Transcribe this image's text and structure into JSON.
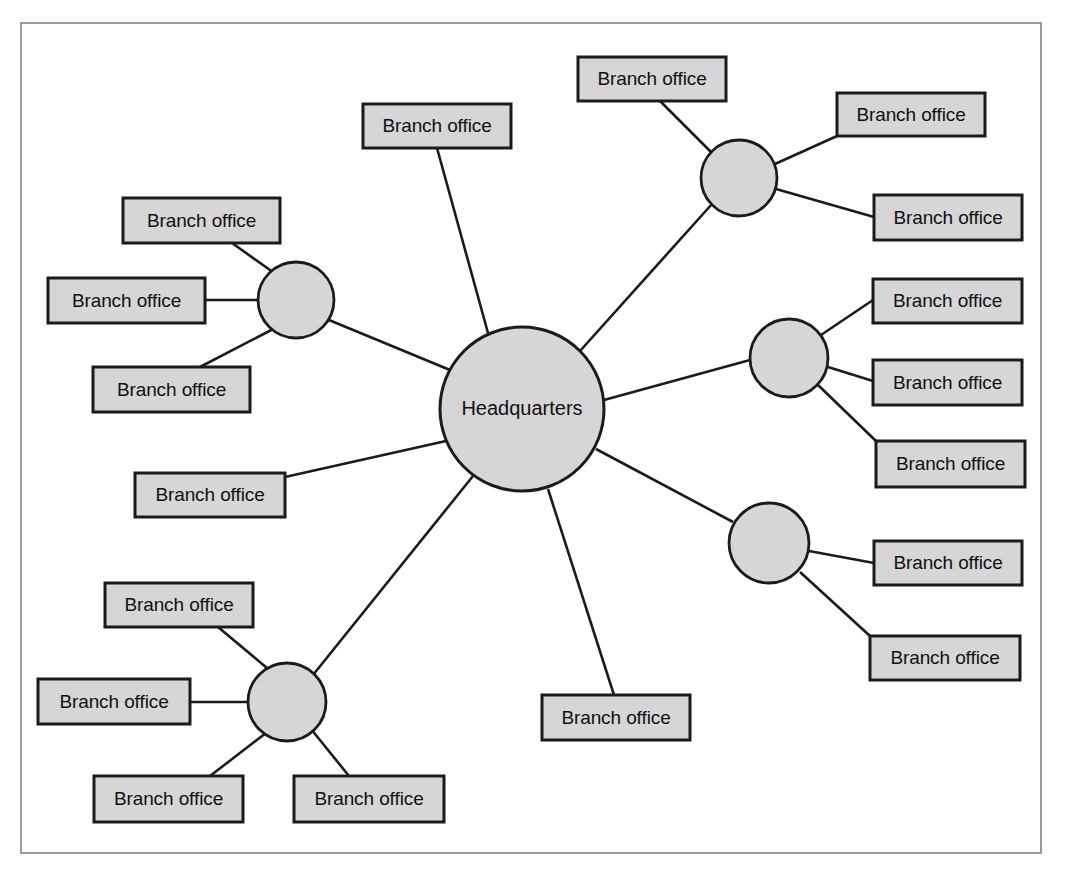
{
  "diagram": {
    "type": "hub-and-spoke-network",
    "canvas": {
      "width": 1065,
      "height": 870
    },
    "frame": {
      "x": 21,
      "y": 23,
      "width": 1020,
      "height": 830,
      "stroke": "#9a9a9a"
    },
    "colors": {
      "node_fill": "#d6d6d6",
      "node_stroke": "#1b1b1b",
      "edge": "#1b1b1b",
      "background": "#ffffff",
      "frame_stroke": "#9a9a9a",
      "text": "#111111"
    },
    "center": {
      "id": "hq",
      "label": "Headquarters",
      "shape": "circle",
      "cx": 522,
      "cy": 409,
      "r": 82
    },
    "hubs": [
      {
        "id": "hub-top-right",
        "label": "",
        "shape": "circle",
        "cx": 739,
        "cy": 178,
        "r": 38
      },
      {
        "id": "hub-left",
        "label": "",
        "shape": "circle",
        "cx": 296,
        "cy": 300,
        "r": 38
      },
      {
        "id": "hub-right-upper",
        "label": "",
        "shape": "circle",
        "cx": 789,
        "cy": 358,
        "r": 39
      },
      {
        "id": "hub-right-lower",
        "label": "",
        "shape": "circle",
        "cx": 769,
        "cy": 543,
        "r": 40
      },
      {
        "id": "hub-bottom-left",
        "label": "",
        "shape": "circle",
        "cx": 287,
        "cy": 702,
        "r": 39
      }
    ],
    "boxes": [
      {
        "id": "box-top-center",
        "label": "Branch office",
        "x": 363,
        "y": 104,
        "width": 148,
        "height": 44,
        "parent": "hq"
      },
      {
        "id": "box-mid-left-direct",
        "label": "Branch office",
        "x": 135,
        "y": 473,
        "width": 150,
        "height": 44,
        "parent": "hq"
      },
      {
        "id": "box-bottom-center",
        "label": "Branch office",
        "x": 542,
        "y": 695,
        "width": 148,
        "height": 45,
        "parent": "hq"
      },
      {
        "id": "box-tr-1",
        "label": "Branch office",
        "x": 578,
        "y": 57,
        "width": 148,
        "height": 44,
        "parent": "hub-top-right"
      },
      {
        "id": "box-tr-2",
        "label": "Branch office",
        "x": 837,
        "y": 93,
        "width": 148,
        "height": 43,
        "parent": "hub-top-right"
      },
      {
        "id": "box-tr-3",
        "label": "Branch office",
        "x": 874,
        "y": 195,
        "width": 148,
        "height": 45,
        "parent": "hub-top-right"
      },
      {
        "id": "box-left-1",
        "label": "Branch office",
        "x": 123,
        "y": 198,
        "width": 157,
        "height": 45,
        "parent": "hub-left"
      },
      {
        "id": "box-left-2",
        "label": "Branch office",
        "x": 48,
        "y": 278,
        "width": 157,
        "height": 45,
        "parent": "hub-left"
      },
      {
        "id": "box-left-3",
        "label": "Branch office",
        "x": 93,
        "y": 367,
        "width": 157,
        "height": 45,
        "parent": "hub-left"
      },
      {
        "id": "box-ru-1",
        "label": "Branch office",
        "x": 873,
        "y": 279,
        "width": 149,
        "height": 44,
        "parent": "hub-right-upper"
      },
      {
        "id": "box-ru-2",
        "label": "Branch office",
        "x": 873,
        "y": 360,
        "width": 149,
        "height": 45,
        "parent": "hub-right-upper"
      },
      {
        "id": "box-ru-3",
        "label": "Branch office",
        "x": 876,
        "y": 441,
        "width": 149,
        "height": 46,
        "parent": "hub-right-upper"
      },
      {
        "id": "box-rl-1",
        "label": "Branch office",
        "x": 874,
        "y": 541,
        "width": 148,
        "height": 44,
        "parent": "hub-right-lower"
      },
      {
        "id": "box-rl-2",
        "label": "Branch office",
        "x": 870,
        "y": 636,
        "width": 150,
        "height": 44,
        "parent": "hub-right-lower"
      },
      {
        "id": "box-bl-1",
        "label": "Branch office",
        "x": 105,
        "y": 583,
        "width": 148,
        "height": 44,
        "parent": "hub-bottom-left"
      },
      {
        "id": "box-bl-2",
        "label": "Branch office",
        "x": 38,
        "y": 679,
        "width": 152,
        "height": 45,
        "parent": "hub-bottom-left"
      },
      {
        "id": "box-bl-3",
        "label": "Branch office",
        "x": 94,
        "y": 776,
        "width": 149,
        "height": 46,
        "parent": "hub-bottom-left"
      },
      {
        "id": "box-bl-4",
        "label": "Branch office",
        "x": 294,
        "y": 776,
        "width": 150,
        "height": 46,
        "parent": "hub-bottom-left"
      }
    ],
    "edges": [
      {
        "id": "edge-hq-hub-top-right",
        "from": "hq",
        "to": "hub-top-right",
        "x1": 580,
        "y1": 351,
        "x2": 712,
        "y2": 204
      },
      {
        "id": "edge-hq-hub-left",
        "from": "hq",
        "to": "hub-left",
        "x1": 450,
        "y1": 370,
        "x2": 329,
        "y2": 320
      },
      {
        "id": "edge-hq-hub-right-upper",
        "from": "hq",
        "to": "hub-right-upper",
        "x1": 604,
        "y1": 400,
        "x2": 750,
        "y2": 360
      },
      {
        "id": "edge-hq-hub-right-lower",
        "from": "hq",
        "to": "hub-right-lower",
        "x1": 596,
        "y1": 449,
        "x2": 733,
        "y2": 522
      },
      {
        "id": "edge-hq-hub-bottom-left",
        "from": "hq",
        "to": "hub-bottom-left",
        "x1": 473,
        "y1": 476,
        "x2": 313,
        "y2": 675
      },
      {
        "id": "edge-hq-box-top-center",
        "from": "hq",
        "to": "box-top-center",
        "x1": 488,
        "y1": 333,
        "x2": 437,
        "y2": 148
      },
      {
        "id": "edge-hq-box-mid-left",
        "from": "hq",
        "to": "box-mid-left-direct",
        "x1": 446,
        "y1": 441,
        "x2": 285,
        "y2": 477
      },
      {
        "id": "edge-hq-box-bottom-center",
        "from": "hq",
        "to": "box-bottom-center",
        "x1": 548,
        "y1": 489,
        "x2": 614,
        "y2": 695
      },
      {
        "id": "edge-tr-1",
        "from": "hub-top-right",
        "to": "box-tr-1",
        "x1": 714,
        "y1": 155,
        "x2": 660,
        "y2": 101
      },
      {
        "id": "edge-tr-2",
        "from": "hub-top-right",
        "to": "box-tr-2",
        "x1": 775,
        "y1": 164,
        "x2": 837,
        "y2": 136
      },
      {
        "id": "edge-tr-3",
        "from": "hub-top-right",
        "to": "box-tr-3",
        "x1": 776,
        "y1": 189,
        "x2": 874,
        "y2": 217
      },
      {
        "id": "edge-left-1",
        "from": "hub-left",
        "to": "box-left-1",
        "x1": 277,
        "y1": 275,
        "x2": 232,
        "y2": 243
      },
      {
        "id": "edge-left-2",
        "from": "hub-left",
        "to": "box-left-2",
        "x1": 258,
        "y1": 300,
        "x2": 205,
        "y2": 300
      },
      {
        "id": "edge-left-3",
        "from": "hub-left",
        "to": "box-left-3",
        "x1": 277,
        "y1": 327,
        "x2": 200,
        "y2": 367
      },
      {
        "id": "edge-ru-1",
        "from": "hub-right-upper",
        "to": "box-ru-1",
        "x1": 818,
        "y1": 337,
        "x2": 873,
        "y2": 300
      },
      {
        "id": "edge-ru-2",
        "from": "hub-right-upper",
        "to": "box-ru-2",
        "x1": 828,
        "y1": 367,
        "x2": 873,
        "y2": 381
      },
      {
        "id": "edge-ru-3",
        "from": "hub-right-upper",
        "to": "box-ru-3",
        "x1": 818,
        "y1": 385,
        "x2": 876,
        "y2": 441
      },
      {
        "id": "edge-rl-1",
        "from": "hub-right-lower",
        "to": "box-rl-1",
        "x1": 809,
        "y1": 551,
        "x2": 874,
        "y2": 563
      },
      {
        "id": "edge-rl-2",
        "from": "hub-right-lower",
        "to": "box-rl-2",
        "x1": 800,
        "y1": 572,
        "x2": 870,
        "y2": 636
      },
      {
        "id": "edge-bl-1",
        "from": "hub-bottom-left",
        "to": "box-bl-1",
        "x1": 267,
        "y1": 668,
        "x2": 218,
        "y2": 627
      },
      {
        "id": "edge-bl-2",
        "from": "hub-bottom-left",
        "to": "box-bl-2",
        "x1": 248,
        "y1": 702,
        "x2": 190,
        "y2": 702
      },
      {
        "id": "edge-bl-3",
        "from": "hub-bottom-left",
        "to": "box-bl-3",
        "x1": 266,
        "y1": 733,
        "x2": 210,
        "y2": 776
      },
      {
        "id": "edge-bl-4",
        "from": "hub-bottom-left",
        "to": "box-bl-4",
        "x1": 311,
        "y1": 729,
        "x2": 349,
        "y2": 776
      }
    ]
  }
}
